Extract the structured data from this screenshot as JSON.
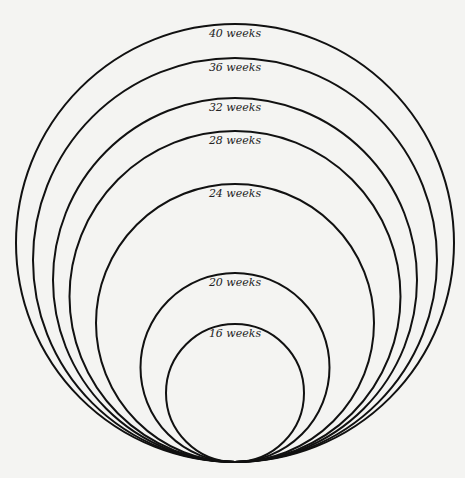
{
  "diagram": {
    "title": "",
    "background": "#f4f4f2",
    "stroke_color": "#111111",
    "tangent_point": {
      "x": 235,
      "y": 462
    },
    "circles": [
      {
        "label": "40 weeks",
        "top_y": 24
      },
      {
        "label": "36 weeks",
        "top_y": 58
      },
      {
        "label": "32 weeks",
        "top_y": 98
      },
      {
        "label": "28 weeks",
        "top_y": 131
      },
      {
        "label": "24 weeks",
        "top_y": 184
      },
      {
        "label": "20 weeks",
        "top_y": 273
      },
      {
        "label": "16 weeks",
        "top_y": 324
      }
    ]
  }
}
